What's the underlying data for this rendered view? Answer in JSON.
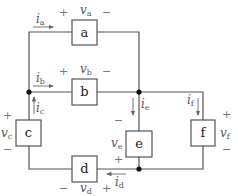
{
  "diagram": {
    "colors": {
      "wire": "#555555",
      "node": "#111111",
      "text": "#444444"
    },
    "elements": [
      {
        "id": "a",
        "label": "a",
        "voltage": "v",
        "voltage_sub": "a",
        "current": "i",
        "current_sub": "a",
        "plus": "+",
        "minus": "−"
      },
      {
        "id": "b",
        "label": "b",
        "voltage": "v",
        "voltage_sub": "b",
        "current": "i",
        "current_sub": "b",
        "plus": "+",
        "minus": "−"
      },
      {
        "id": "c",
        "label": "c",
        "voltage": "v",
        "voltage_sub": "c",
        "current": "i",
        "current_sub": "c",
        "plus": "+",
        "minus": "−"
      },
      {
        "id": "d",
        "label": "d",
        "voltage": "v",
        "voltage_sub": "d",
        "current": "i",
        "current_sub": "d",
        "plus": "+",
        "minus": "−"
      },
      {
        "id": "e",
        "label": "e",
        "voltage": "v",
        "voltage_sub": "e",
        "current": "i",
        "current_sub": "e",
        "plus": "+",
        "minus": "−"
      },
      {
        "id": "f",
        "label": "f",
        "voltage": "v",
        "voltage_sub": "f",
        "current": "i",
        "current_sub": "f",
        "plus": "+",
        "minus": "−"
      }
    ]
  }
}
